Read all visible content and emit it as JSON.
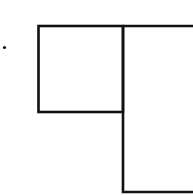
{
  "diagram": {
    "stroke_color": "#111111",
    "background_color": "#ffffff",
    "stroke_width": 2.6,
    "marker": {
      "shape": "dot",
      "cx": 4.5,
      "cy": 47.5,
      "r": 1.6
    },
    "left_box": {
      "x": 38.5,
      "y": 26,
      "width": 84.5,
      "height": 86
    },
    "right_box": {
      "x": 123,
      "y": 26,
      "width": 80,
      "height": 166,
      "clipped_right": true
    }
  }
}
